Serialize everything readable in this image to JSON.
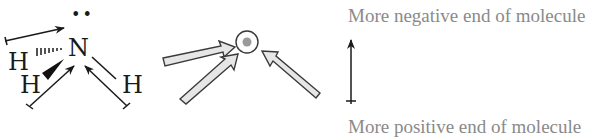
{
  "molecule": {
    "central_atom": "N",
    "lone_pair": "••",
    "hydrogens": [
      "H",
      "H",
      "H"
    ]
  },
  "labels": {
    "negative_end": "More negative end of molecule",
    "positive_end": "More positive end of molecule"
  },
  "colors": {
    "ink": "#1a1a1a",
    "label_gray": "#8a8a8a",
    "arrow_fill": "#e6e6e6",
    "arrow_stroke": "#3a3a3a",
    "center_dot": "#9a9a9a"
  }
}
